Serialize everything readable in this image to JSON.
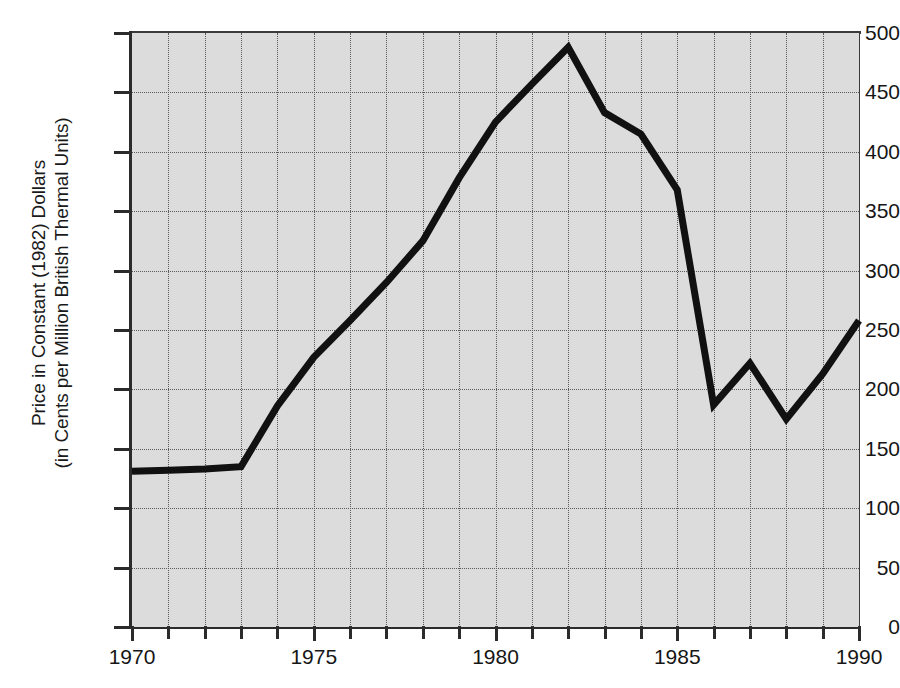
{
  "chart_data": {
    "type": "line",
    "title": "",
    "xlabel": "",
    "ylabel_line1": "Price in Constant (1982) Dollars",
    "ylabel_line2": "(in Cents per Million British Thermal Units)",
    "ylabel": "Price in Constant (1982) Dollars (in Cents per Million British Thermal Units)",
    "xlim": [
      1970,
      1990
    ],
    "ylim": [
      0,
      500
    ],
    "x_tick_labels": [
      "1970",
      "1975",
      "1980",
      "1985",
      "1990"
    ],
    "x_tick_label_values": [
      1970,
      1975,
      1980,
      1985,
      1990
    ],
    "x_minor_ticks": [
      1971,
      1972,
      1973,
      1974,
      1976,
      1977,
      1978,
      1979,
      1981,
      1982,
      1983,
      1984,
      1986,
      1987,
      1988,
      1989
    ],
    "y_tick_labels": [
      "0",
      "50",
      "100",
      "150",
      "200",
      "250",
      "300",
      "350",
      "400",
      "450",
      "500"
    ],
    "y_tick_values": [
      0,
      50,
      100,
      150,
      200,
      250,
      300,
      350,
      400,
      450,
      500
    ],
    "grid": true,
    "grid_style": "dotted",
    "legend": "none",
    "plot_background": "#dcdcdc",
    "line_color": "#111111",
    "line_width": 7,
    "x": [
      1970,
      1971,
      1972,
      1973,
      1974,
      1975,
      1976,
      1977,
      1978,
      1979,
      1980,
      1981,
      1982,
      1983,
      1984,
      1985,
      1986,
      1987,
      1988,
      1989,
      1990
    ],
    "values": [
      131,
      132,
      133,
      135,
      186,
      227,
      258,
      290,
      325,
      378,
      425,
      457,
      488,
      433,
      415,
      368,
      187,
      222,
      175,
      213,
      258
    ],
    "series": [
      {
        "name": "Price in Constant (1982) Dollars",
        "values": [
          131,
          132,
          133,
          135,
          186,
          227,
          258,
          290,
          325,
          378,
          425,
          457,
          488,
          433,
          415,
          368,
          187,
          222,
          175,
          213,
          258
        ]
      }
    ]
  }
}
